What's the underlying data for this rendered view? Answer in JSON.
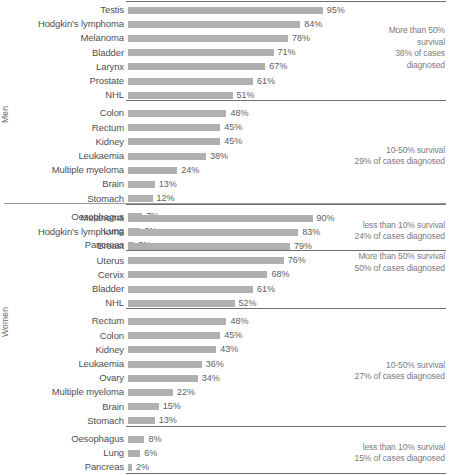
{
  "chart_data": {
    "type": "bar",
    "title": "",
    "subtitle": "",
    "xlabel": "",
    "ylabel": "",
    "xlim": [
      0,
      100
    ],
    "grid": false,
    "orientation": "horizontal",
    "value_suffix": "%",
    "groups": [
      {
        "name": "Men",
        "axis_label": "Men",
        "bands": [
          {
            "band_label": "More than 50%\nsurvival\n38% of cases\ndiagnosed",
            "rows": [
              {
                "label": "Testis",
                "value": 95,
                "value_label": "95%"
              },
              {
                "label": "Hodgkin's lymphoma",
                "value": 84,
                "value_label": "84%"
              },
              {
                "label": "Melanoma",
                "value": 78,
                "value_label": "78%"
              },
              {
                "label": "Bladder",
                "value": 71,
                "value_label": "71%"
              },
              {
                "label": "Larynx",
                "value": 67,
                "value_label": "67%"
              },
              {
                "label": "Prostate",
                "value": 61,
                "value_label": "61%"
              },
              {
                "label": "NHL",
                "value": 51,
                "value_label": "51%"
              }
            ]
          },
          {
            "band_label": "10-50% survival\n29% of cases diagnosed",
            "rows": [
              {
                "label": "Colon",
                "value": 48,
                "value_label": "48%"
              },
              {
                "label": "Rectum",
                "value": 45,
                "value_label": "45%"
              },
              {
                "label": "Kidney",
                "value": 45,
                "value_label": "45%"
              },
              {
                "label": "Leukaemia",
                "value": 38,
                "value_label": "38%"
              },
              {
                "label": "Multiple myeloma",
                "value": 24,
                "value_label": "24%"
              },
              {
                "label": "Brain",
                "value": 13,
                "value_label": "13%"
              },
              {
                "label": "Stomach",
                "value": 12,
                "value_label": "12%"
              }
            ]
          },
          {
            "band_label": "less than 10% survival\n24% of cases diagnosed",
            "rows": [
              {
                "label": "Oesophagus",
                "value": 7,
                "value_label": "7%"
              },
              {
                "label": "Lung",
                "value": 6,
                "value_label": "6%"
              },
              {
                "label": "Pancreas",
                "value": 3,
                "value_label": "3%"
              }
            ]
          }
        ]
      },
      {
        "name": "Women",
        "axis_label": "Women",
        "bands": [
          {
            "band_label": "More than 50% survival\n50% of cases diagnosed",
            "rows": [
              {
                "label": "Melanoma",
                "value": 90,
                "value_label": "90%"
              },
              {
                "label": "Hodgkin's lymphoma",
                "value": 83,
                "value_label": "83%"
              },
              {
                "label": "Breast",
                "value": 79,
                "value_label": "79%"
              },
              {
                "label": "Uterus",
                "value": 76,
                "value_label": "76%"
              },
              {
                "label": "Cervix",
                "value": 68,
                "value_label": "68%"
              },
              {
                "label": "Bladder",
                "value": 61,
                "value_label": "61%"
              },
              {
                "label": "NHL",
                "value": 52,
                "value_label": "52%"
              }
            ]
          },
          {
            "band_label": "10-50% survival\n27% of cases diagnosed",
            "rows": [
              {
                "label": "Rectum",
                "value": 48,
                "value_label": "48%"
              },
              {
                "label": "Colon",
                "value": 45,
                "value_label": "45%"
              },
              {
                "label": "Kidney",
                "value": 43,
                "value_label": "43%"
              },
              {
                "label": "Leukaemia",
                "value": 36,
                "value_label": "36%"
              },
              {
                "label": "Ovary",
                "value": 34,
                "value_label": "34%"
              },
              {
                "label": "Multiple myeloma",
                "value": 22,
                "value_label": "22%"
              },
              {
                "label": "Brain",
                "value": 15,
                "value_label": "15%"
              },
              {
                "label": "Stomach",
                "value": 13,
                "value_label": "13%"
              }
            ]
          },
          {
            "band_label": "less than 10% survival\n15% of cases diagnosed",
            "rows": [
              {
                "label": "Oesophagus",
                "value": 8,
                "value_label": "8%"
              },
              {
                "label": "Lung",
                "value": 6,
                "value_label": "6%"
              },
              {
                "label": "Pancreas",
                "value": 2,
                "value_label": "2%"
              }
            ]
          }
        ]
      }
    ],
    "colors": {
      "bar": "#b0b0b0",
      "label_text": "#4f4f4f",
      "value_text": "#5e5e5e",
      "annotation_text": "#7b7b7b",
      "rule": "#6f6f6f",
      "background": "#ffffff"
    }
  }
}
